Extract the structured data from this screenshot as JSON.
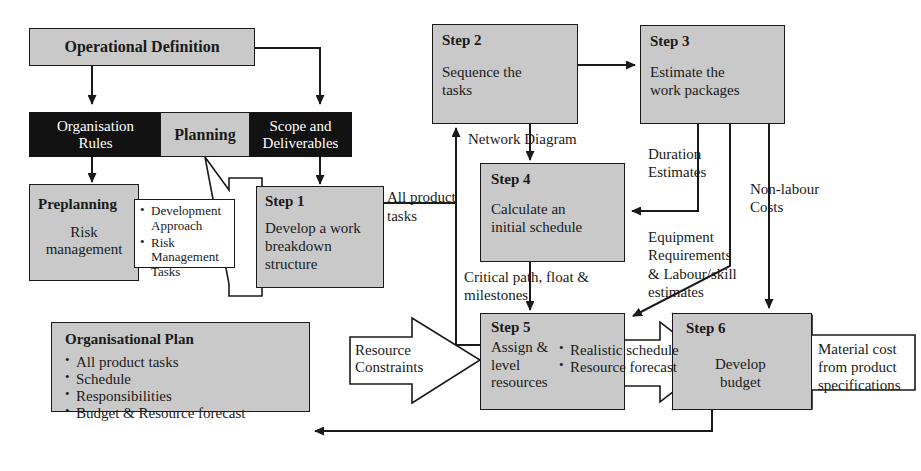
{
  "diagram": {
    "colors": {
      "node_fill": "#c9c9c9",
      "node_white": "#ffffff",
      "node_black": "#121212",
      "stroke": "#1a1a1a",
      "text": "#1a1a1a",
      "text_inverse": "#ffffff"
    }
  },
  "nodes": {
    "operational_definition": {
      "title": "Operational Definition"
    },
    "bar": {
      "organisation_rules_line1": "Organisation",
      "organisation_rules_line2": "Rules",
      "planning": "Planning",
      "scope_line1": "Scope and",
      "scope_line2": "Deliverables"
    },
    "preplanning": {
      "title": "Preplanning",
      "body_line1": "Risk",
      "body_line2": "management"
    },
    "preplanning_callout": {
      "items": [
        "Development Approach",
        "Risk Management Tasks"
      ]
    },
    "step1": {
      "title": "Step 1",
      "body_line1": "Develop a work",
      "body_line2": "breakdown",
      "body_line3": "structure"
    },
    "step2": {
      "title": "Step 2",
      "body_line1": "Sequence the",
      "body_line2": "tasks"
    },
    "step3": {
      "title": "Step 3",
      "body_line1": "Estimate the",
      "body_line2": "work packages"
    },
    "step4": {
      "title": "Step 4",
      "body_line1": "Calculate an",
      "body_line2": "initial schedule"
    },
    "step5": {
      "title": "Step 5",
      "body_line1": "Assign &",
      "body_line2": "level",
      "body_line3": "resources"
    },
    "step5_callout": {
      "items": [
        "Realistic schedule",
        "Resource forecast"
      ]
    },
    "step6": {
      "title": "Step 6",
      "body_line1": "Develop",
      "body_line2": "budget"
    },
    "organisational_plan": {
      "title": "Organisational Plan",
      "items": [
        "All product tasks",
        "Schedule",
        "Responsibilities",
        "Budget & Resource forecast"
      ]
    },
    "resource_constraints": {
      "line1": "Resource",
      "line2": "Constraints"
    },
    "material_cost": {
      "line1": "Material cost",
      "line2": "from product",
      "line3": "specifications"
    }
  },
  "edge_labels": {
    "all_product_tasks_line1": "All product",
    "all_product_tasks_line2": "tasks",
    "network_diagram": "Network Diagram",
    "duration_estimates_line1": "Duration",
    "duration_estimates_line2": "Estimates",
    "non_labour_costs_line1": "Non-labour",
    "non_labour_costs_line2": "Costs",
    "equipment_line1": "Equipment",
    "equipment_line2": "Requirements",
    "equipment_line3": "& Labour/skill",
    "equipment_line4": "estimates",
    "critical_path_line1": "Critical path, float &",
    "critical_path_line2": "milestones"
  }
}
